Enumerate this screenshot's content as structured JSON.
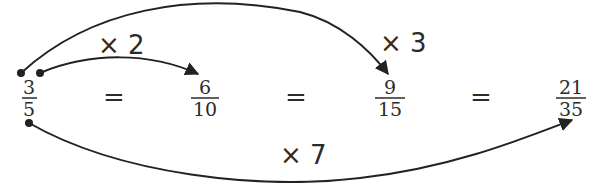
{
  "diagram": {
    "fractions": [
      {
        "numerator": "3",
        "denominator": "5"
      },
      {
        "numerator": "6",
        "denominator": "10"
      },
      {
        "numerator": "9",
        "denominator": "15"
      },
      {
        "numerator": "21",
        "denominator": "35"
      }
    ],
    "equals": [
      "=",
      "=",
      "="
    ],
    "arrows": [
      {
        "label": "× 2",
        "from": "3/5",
        "to": "6/10"
      },
      {
        "label": "× 3",
        "from": "3/5",
        "to": "9/15"
      },
      {
        "label": "× 7",
        "from": "3/5",
        "to": "21/35"
      }
    ],
    "colors": {
      "ink": "#222222",
      "background": "#ffffff"
    }
  }
}
